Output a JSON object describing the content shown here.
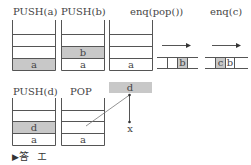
{
  "colors": {
    "line": "#555555",
    "fill": "#c8c8c8",
    "text": "#444444"
  },
  "steps": [
    {
      "label": "PUSH(a)",
      "type": "stack",
      "cells": [
        "",
        "",
        "",
        "a"
      ],
      "highlight": 3
    },
    {
      "label": "PUSH(b)",
      "type": "stack",
      "cells": [
        "",
        "",
        "b",
        "a"
      ],
      "highlight": 2
    },
    {
      "label": "enq(pop())",
      "type": "stack",
      "cells": [
        "",
        "",
        "",
        "a"
      ],
      "highlight": -1
    },
    {
      "label": "",
      "type": "queue",
      "cells": [
        "",
        "",
        "b",
        ""
      ],
      "highlight": 2,
      "arrow": "right-arrow"
    },
    {
      "label": "enq(c)",
      "type": "queue",
      "cells": [
        "",
        "c",
        "b",
        ""
      ],
      "highlight": 1,
      "arrow": "right-arrow"
    },
    {
      "label": "PUSH(d)",
      "type": "stack",
      "cells": [
        "",
        "",
        "d",
        "a"
      ],
      "highlight": 2
    },
    {
      "label": "POP",
      "type": "stack",
      "cells": [
        "",
        "",
        "",
        "a"
      ],
      "highlight": -1
    }
  ],
  "popped": {
    "value": "d",
    "target": "x"
  },
  "answer": {
    "marker": "▶",
    "label": "答",
    "value": "エ"
  }
}
